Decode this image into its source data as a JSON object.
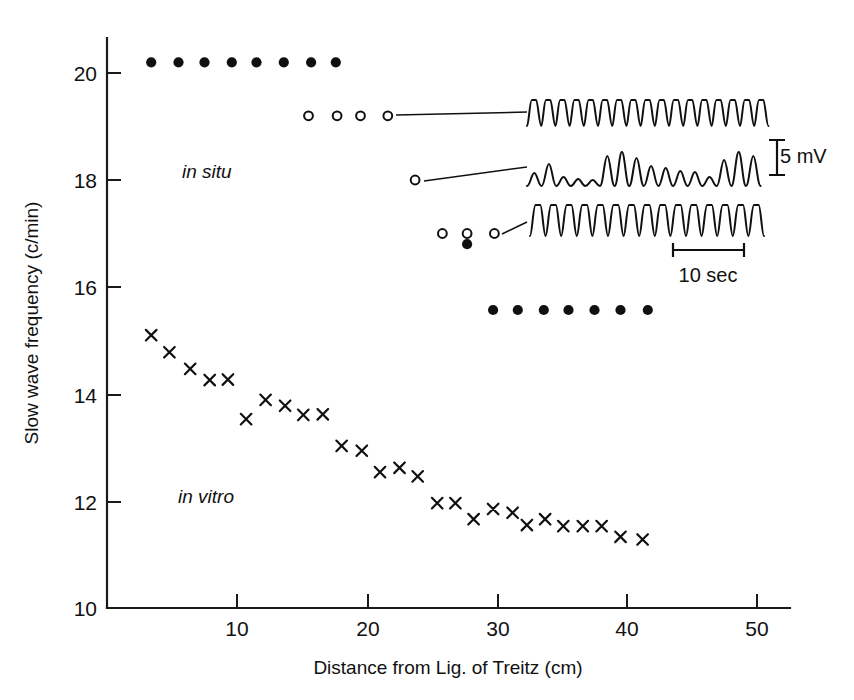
{
  "chart_data": {
    "type": "scatter",
    "title": "",
    "xlabel": "Distance from Lig. of Treitz (cm)",
    "ylabel": "Slow wave frequency (c/min)",
    "xlim": [
      0,
      52
    ],
    "ylim": [
      10,
      20.8
    ],
    "xticks": [
      10,
      20,
      30,
      40,
      50
    ],
    "yticks": [
      10,
      12,
      14,
      16,
      18,
      20
    ],
    "xtick_labels": [
      "10",
      "20",
      "30",
      "40",
      "50"
    ],
    "ytick_labels": [
      "10",
      "12",
      "14",
      "16",
      "18",
      "20"
    ],
    "grid": false,
    "legend_position": "inline-annotations",
    "annotations": [
      {
        "text": "in situ",
        "x": 12.0,
        "y": 18.35,
        "style": "italic"
      },
      {
        "text": "in vitro",
        "x": 11.5,
        "y": 12.05,
        "style": "italic"
      }
    ],
    "series": [
      {
        "name": "in situ (filled circles, proximal)",
        "marker": "filled-circle",
        "points": [
          {
            "x": 3.4,
            "y": 20.2
          },
          {
            "x": 5.5,
            "y": 20.2
          },
          {
            "x": 7.5,
            "y": 20.2
          },
          {
            "x": 9.6,
            "y": 20.2
          },
          {
            "x": 11.5,
            "y": 20.2
          },
          {
            "x": 13.6,
            "y": 20.2
          },
          {
            "x": 15.7,
            "y": 20.2
          },
          {
            "x": 17.6,
            "y": 20.2
          }
        ]
      },
      {
        "name": "in situ (open circles, 19.2 c/min plateau)",
        "marker": "open-circle",
        "points": [
          {
            "x": 15.5,
            "y": 19.2
          },
          {
            "x": 17.7,
            "y": 19.2
          },
          {
            "x": 19.5,
            "y": 19.2
          },
          {
            "x": 21.6,
            "y": 19.2
          }
        ]
      },
      {
        "name": "in situ (open circle, 18.0 c/min)",
        "marker": "open-circle",
        "points": [
          {
            "x": 23.7,
            "y": 18.0
          }
        ]
      },
      {
        "name": "in situ (open circles, 17.0 c/min)",
        "marker": "open-circle",
        "points": [
          {
            "x": 25.8,
            "y": 17.0
          },
          {
            "x": 27.7,
            "y": 17.0
          },
          {
            "x": 29.8,
            "y": 17.0
          }
        ]
      },
      {
        "name": "in situ (filled circle, 16.8 c/min)",
        "marker": "filled-circle",
        "points": [
          {
            "x": 27.7,
            "y": 16.8
          }
        ]
      },
      {
        "name": "in situ (filled circles, distal 15.6 c/min)",
        "marker": "filled-circle",
        "points": [
          {
            "x": 29.7,
            "y": 15.57
          },
          {
            "x": 31.6,
            "y": 15.57
          },
          {
            "x": 33.6,
            "y": 15.57
          },
          {
            "x": 35.5,
            "y": 15.57
          },
          {
            "x": 37.5,
            "y": 15.57
          },
          {
            "x": 39.5,
            "y": 15.57
          },
          {
            "x": 41.6,
            "y": 15.57
          }
        ]
      },
      {
        "name": "in vitro",
        "marker": "cross",
        "points": [
          {
            "x": 3.4,
            "y": 15.1
          },
          {
            "x": 4.8,
            "y": 14.78
          },
          {
            "x": 6.4,
            "y": 14.47
          },
          {
            "x": 7.9,
            "y": 14.26
          },
          {
            "x": 9.3,
            "y": 14.27
          },
          {
            "x": 10.7,
            "y": 13.53
          },
          {
            "x": 12.2,
            "y": 13.89
          },
          {
            "x": 13.7,
            "y": 13.78
          },
          {
            "x": 15.1,
            "y": 13.61
          },
          {
            "x": 16.6,
            "y": 13.62
          },
          {
            "x": 18.05,
            "y": 13.03
          },
          {
            "x": 19.6,
            "y": 12.94
          },
          {
            "x": 21.0,
            "y": 12.54
          },
          {
            "x": 22.5,
            "y": 12.62
          },
          {
            "x": 23.9,
            "y": 12.46
          },
          {
            "x": 25.4,
            "y": 11.96
          },
          {
            "x": 26.8,
            "y": 11.96
          },
          {
            "x": 28.2,
            "y": 11.66
          },
          {
            "x": 29.7,
            "y": 11.85
          },
          {
            "x": 31.2,
            "y": 11.78
          },
          {
            "x": 32.3,
            "y": 11.55
          },
          {
            "x": 33.7,
            "y": 11.66
          },
          {
            "x": 35.1,
            "y": 11.53
          },
          {
            "x": 36.6,
            "y": 11.53
          },
          {
            "x": 38.05,
            "y": 11.53
          },
          {
            "x": 39.5,
            "y": 11.33
          },
          {
            "x": 41.2,
            "y": 11.28
          }
        ]
      }
    ],
    "inset_traces": [
      {
        "name": "trace-top",
        "linked_point": {
          "x": 21.6,
          "y": 19.2
        },
        "waveform": "regular-fast-slow-waves"
      },
      {
        "name": "trace-middle",
        "linked_point": {
          "x": 23.7,
          "y": 18.0
        },
        "waveform": "irregular-transition-slow-waves"
      },
      {
        "name": "trace-bottom",
        "linked_point": {
          "x": 29.8,
          "y": 17.0
        },
        "waveform": "regular-slow-waves"
      }
    ],
    "scale_bars": [
      {
        "name": "voltage-scale",
        "label": "5 mV",
        "orientation": "vertical"
      },
      {
        "name": "time-scale",
        "label": "10 sec",
        "orientation": "horizontal"
      }
    ]
  },
  "axes": {
    "y_title": "Slow wave frequency (c/min)",
    "x_title": "Distance from Lig. of Treitz (cm)",
    "y_tick_labels": [
      "20",
      "18",
      "16",
      "14",
      "12",
      "10"
    ],
    "x_tick_labels": [
      "10",
      "20",
      "30",
      "40",
      "50"
    ]
  },
  "labels": {
    "in_situ": "in situ",
    "in_vitro": "in vitro",
    "mv_scale": "5 mV",
    "sec_scale": "10 sec"
  },
  "colors": {
    "ink": "#101010",
    "background": "#ffffff"
  }
}
